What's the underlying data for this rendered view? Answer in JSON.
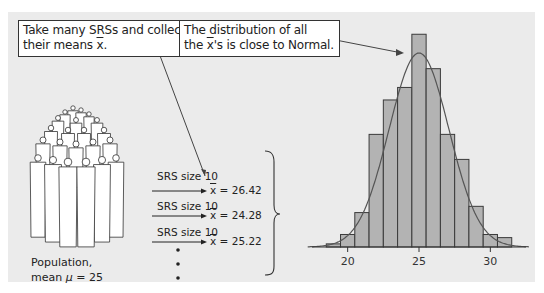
{
  "callouts": {
    "left": {
      "line1": "Take many SRSs and collect",
      "line2_prefix": "their means ",
      "line2_symbol": "x",
      "line2_suffix": "."
    },
    "right": {
      "line1": "The distribution of all",
      "line2_prefix": "the ",
      "line2_symbol": "x",
      "line2_suffix": "'s is close to Normal."
    }
  },
  "population": {
    "label_line1": "Population,",
    "label_line2_prefix": "mean ",
    "label_line2_symbol": "μ",
    "label_line2_suffix": " = 25",
    "icon": "crowd-of-people-illustration"
  },
  "samples": [
    {
      "label": "SRS size 10",
      "symbol": "x",
      "value": "= 26.42"
    },
    {
      "label": "SRS size 10",
      "symbol": "x",
      "value": "= 24.28"
    },
    {
      "label": "SRS size 10",
      "symbol": "x",
      "value": "= 25.22"
    }
  ],
  "continuation": "⋮",
  "colors": {
    "panel": "#ebebeb",
    "bar_fill": "#b3b3b3",
    "stroke": "#3a3a3a",
    "curve": "#555555",
    "callout_bg": "#ffffff"
  },
  "chart_data": {
    "type": "bar",
    "title": "",
    "xlabel": "",
    "ylabel": "",
    "bin_width": 1,
    "bin_centers": [
      19,
      20,
      21,
      22,
      23,
      24,
      25,
      26,
      27,
      28,
      29,
      30,
      31
    ],
    "values": [
      1,
      4,
      11,
      36,
      47,
      51,
      68,
      57,
      36,
      28,
      13,
      4,
      3
    ],
    "x_ticks": [
      20,
      25,
      30
    ],
    "x_tick_labels": [
      "20",
      "25",
      "30"
    ],
    "xlim": [
      17.5,
      32.5
    ],
    "ylim": [
      0,
      70
    ],
    "overlay": {
      "type": "normal-curve",
      "mean": 25,
      "sd": 2.1
    },
    "grid": false,
    "legend": "none"
  }
}
